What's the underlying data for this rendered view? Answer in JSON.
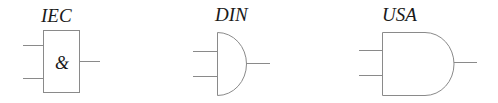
{
  "gates": [
    {
      "standard": "IEC",
      "symbol_text": "&",
      "shape": "rectangle",
      "inputs": 2,
      "outputs": 1
    },
    {
      "standard": "DIN",
      "symbol_text": "",
      "shape": "half-circle",
      "inputs": 2,
      "outputs": 1
    },
    {
      "standard": "USA",
      "symbol_text": "",
      "shape": "d-shape",
      "inputs": 2,
      "outputs": 1
    }
  ],
  "colors": {
    "line": "#8a8a8a",
    "text": "#1a1a1a",
    "background": "#ffffff"
  }
}
